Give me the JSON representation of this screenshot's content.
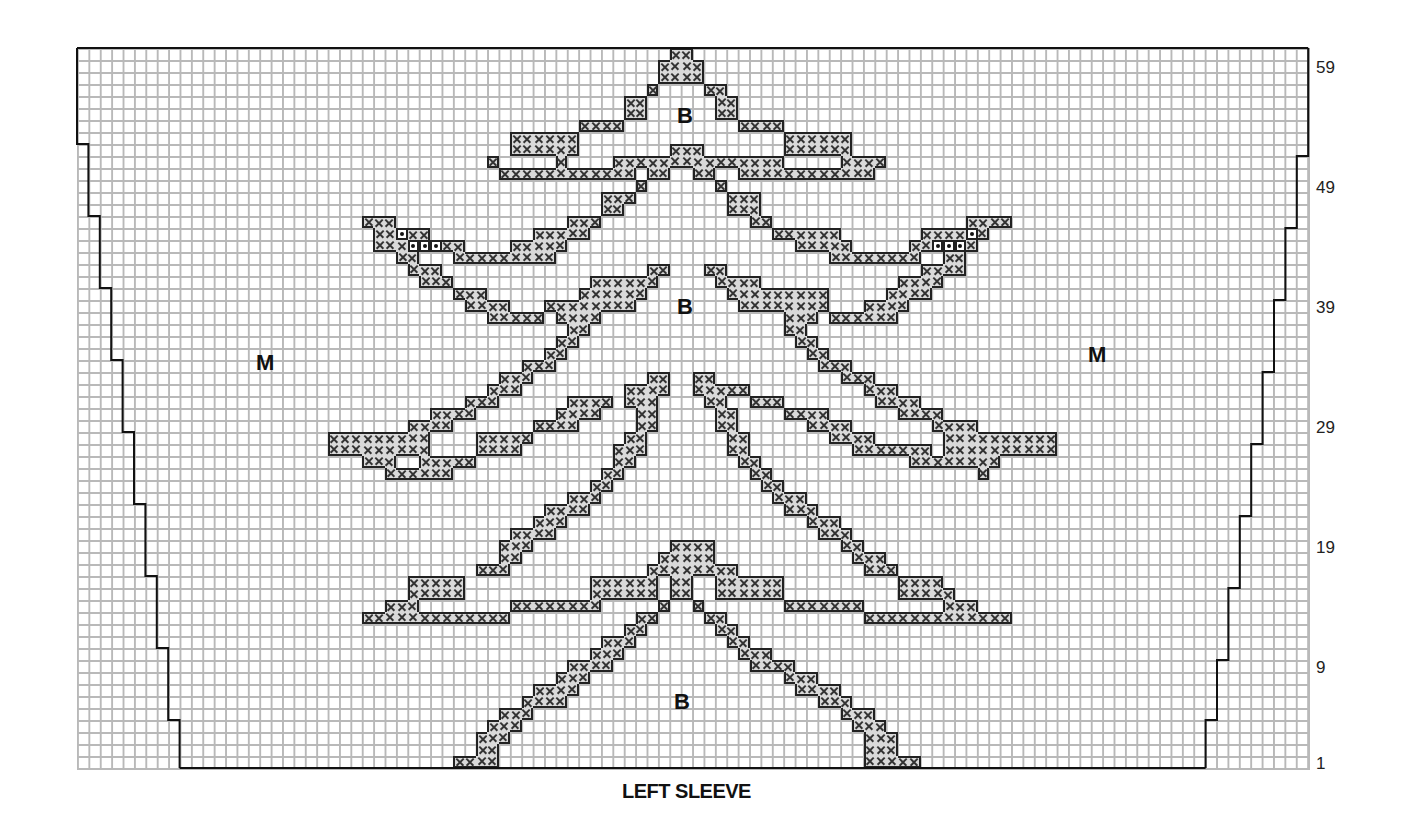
{
  "chart_data": {
    "type": "knitting-chart",
    "title": "LEFT SLEEVE",
    "grid": {
      "columns": 108,
      "rows": 60,
      "cell_w": 11.4,
      "cell_h": 12,
      "left": 77,
      "top": 48
    },
    "row_labels": [
      "59",
      "49",
      "39",
      "29",
      "19",
      "9",
      "1"
    ],
    "row_label_rows": [
      59,
      49,
      39,
      29,
      19,
      9,
      1
    ],
    "color_key": [
      {
        "symbol": "M",
        "meaning": "main color (background)"
      },
      {
        "symbol": "B",
        "meaning": "contrast color B"
      },
      {
        "symbol": "x",
        "meaning": "contrast stitch"
      },
      {
        "symbol": "•",
        "meaning": "special stitch (dot)"
      }
    ],
    "zone_labels": [
      {
        "text": "M",
        "x": 256,
        "y": 350
      },
      {
        "text": "M",
        "x": 1088,
        "y": 342
      },
      {
        "text": "B",
        "x": 677,
        "y": 103
      },
      {
        "text": "B",
        "x": 677,
        "y": 294
      },
      {
        "text": "B",
        "x": 674,
        "y": 689
      }
    ],
    "outline_left": [
      [
        0,
        60
      ],
      [
        0,
        52
      ],
      [
        1,
        52
      ],
      [
        1,
        46
      ],
      [
        2,
        46
      ],
      [
        2,
        40
      ],
      [
        3,
        40
      ],
      [
        3,
        34
      ],
      [
        4,
        34
      ],
      [
        4,
        28
      ],
      [
        5,
        28
      ],
      [
        5,
        22
      ],
      [
        6,
        22
      ],
      [
        6,
        16
      ],
      [
        7,
        16
      ],
      [
        7,
        10
      ],
      [
        8,
        10
      ],
      [
        8,
        4
      ],
      [
        9,
        4
      ],
      [
        9,
        0
      ]
    ],
    "outline_right": [
      [
        108,
        60
      ],
      [
        108,
        51
      ],
      [
        107,
        51
      ],
      [
        107,
        45
      ],
      [
        106,
        45
      ],
      [
        106,
        39
      ],
      [
        105,
        39
      ],
      [
        105,
        33
      ],
      [
        104,
        33
      ],
      [
        104,
        27
      ],
      [
        103,
        27
      ],
      [
        103,
        21
      ],
      [
        102,
        21
      ],
      [
        102,
        15
      ],
      [
        101,
        15
      ],
      [
        101,
        9
      ],
      [
        100,
        9
      ],
      [
        100,
        4
      ],
      [
        99,
        4
      ],
      [
        99,
        0
      ]
    ],
    "stitch_runs": [
      [
        60,
        52,
        53
      ],
      [
        59,
        51,
        54
      ],
      [
        58,
        51,
        54
      ],
      [
        57,
        50,
        50
      ],
      [
        57,
        55,
        56
      ],
      [
        56,
        48,
        49
      ],
      [
        56,
        56,
        57
      ],
      [
        55,
        48,
        49
      ],
      [
        55,
        56,
        57
      ],
      [
        54,
        44,
        47
      ],
      [
        54,
        58,
        61
      ],
      [
        53,
        38,
        43
      ],
      [
        53,
        62,
        67
      ],
      [
        52,
        38,
        43
      ],
      [
        52,
        52,
        54
      ],
      [
        52,
        62,
        67
      ],
      [
        51,
        36,
        36
      ],
      [
        51,
        42,
        42
      ],
      [
        51,
        47,
        50
      ],
      [
        51,
        51,
        55
      ],
      [
        51,
        56,
        60
      ],
      [
        51,
        61,
        61
      ],
      [
        51,
        67,
        70
      ],
      [
        50,
        37,
        46
      ],
      [
        50,
        47,
        48
      ],
      [
        50,
        50,
        51
      ],
      [
        50,
        54,
        55
      ],
      [
        50,
        58,
        69
      ],
      [
        49,
        49,
        49
      ],
      [
        49,
        56,
        56
      ],
      [
        48,
        46,
        48
      ],
      [
        48,
        57,
        59
      ],
      [
        47,
        46,
        47
      ],
      [
        47,
        57,
        59
      ],
      [
        46,
        25,
        27
      ],
      [
        46,
        43,
        45
      ],
      [
        46,
        59,
        60
      ],
      [
        46,
        78,
        81
      ],
      [
        45,
        26,
        30
      ],
      [
        45,
        40,
        44
      ],
      [
        45,
        61,
        66
      ],
      [
        45,
        74,
        79
      ],
      [
        44,
        26,
        28
      ],
      [
        44,
        30,
        33
      ],
      [
        44,
        38,
        42
      ],
      [
        44,
        63,
        67
      ],
      [
        44,
        73,
        78
      ],
      [
        43,
        28,
        29
      ],
      [
        43,
        33,
        41
      ],
      [
        43,
        66,
        73
      ],
      [
        43,
        76,
        77
      ],
      [
        42,
        29,
        31
      ],
      [
        42,
        50,
        51
      ],
      [
        42,
        55,
        56
      ],
      [
        42,
        74,
        77
      ],
      [
        41,
        30,
        32
      ],
      [
        41,
        45,
        50
      ],
      [
        41,
        56,
        59
      ],
      [
        41,
        72,
        75
      ],
      [
        40,
        33,
        35
      ],
      [
        40,
        44,
        49
      ],
      [
        40,
        57,
        65
      ],
      [
        40,
        71,
        74
      ],
      [
        39,
        34,
        37
      ],
      [
        39,
        41,
        48
      ],
      [
        39,
        58,
        65
      ],
      [
        39,
        69,
        72
      ],
      [
        38,
        36,
        40
      ],
      [
        38,
        42,
        45
      ],
      [
        38,
        62,
        64
      ],
      [
        38,
        66,
        71
      ],
      [
        37,
        43,
        44
      ],
      [
        37,
        62,
        63
      ],
      [
        36,
        42,
        43
      ],
      [
        36,
        63,
        64
      ],
      [
        35,
        41,
        42
      ],
      [
        35,
        64,
        65
      ],
      [
        34,
        39,
        41
      ],
      [
        34,
        65,
        67
      ],
      [
        33,
        37,
        39
      ],
      [
        33,
        50,
        51
      ],
      [
        33,
        54,
        55
      ],
      [
        33,
        67,
        69
      ],
      [
        32,
        36,
        38
      ],
      [
        32,
        48,
        51
      ],
      [
        32,
        54,
        58
      ],
      [
        32,
        69,
        71
      ],
      [
        31,
        34,
        36
      ],
      [
        31,
        43,
        46
      ],
      [
        31,
        48,
        50
      ],
      [
        31,
        55,
        56
      ],
      [
        31,
        59,
        61
      ],
      [
        31,
        70,
        73
      ],
      [
        30,
        31,
        34
      ],
      [
        30,
        42,
        45
      ],
      [
        30,
        49,
        50
      ],
      [
        30,
        56,
        57
      ],
      [
        30,
        62,
        65
      ],
      [
        30,
        72,
        75
      ],
      [
        29,
        29,
        32
      ],
      [
        29,
        40,
        43
      ],
      [
        29,
        49,
        50
      ],
      [
        29,
        56,
        57
      ],
      [
        29,
        64,
        67
      ],
      [
        29,
        75,
        78
      ],
      [
        28,
        22,
        30
      ],
      [
        28,
        35,
        39
      ],
      [
        28,
        48,
        49
      ],
      [
        28,
        57,
        58
      ],
      [
        28,
        66,
        69
      ],
      [
        28,
        76,
        85
      ],
      [
        27,
        22,
        30
      ],
      [
        27,
        35,
        38
      ],
      [
        27,
        47,
        49
      ],
      [
        27,
        57,
        58
      ],
      [
        27,
        68,
        74
      ],
      [
        27,
        76,
        85
      ],
      [
        26,
        25,
        27
      ],
      [
        26,
        30,
        34
      ],
      [
        26,
        47,
        48
      ],
      [
        26,
        58,
        59
      ],
      [
        26,
        73,
        80
      ],
      [
        25,
        27,
        32
      ],
      [
        25,
        46,
        47
      ],
      [
        25,
        59,
        60
      ],
      [
        25,
        79,
        79
      ],
      [
        24,
        45,
        46
      ],
      [
        24,
        60,
        61
      ],
      [
        23,
        43,
        45
      ],
      [
        23,
        61,
        63
      ],
      [
        22,
        41,
        44
      ],
      [
        22,
        62,
        64
      ],
      [
        21,
        40,
        42
      ],
      [
        21,
        64,
        66
      ],
      [
        20,
        38,
        41
      ],
      [
        20,
        65,
        67
      ],
      [
        19,
        37,
        39
      ],
      [
        19,
        52,
        55
      ],
      [
        19,
        67,
        68
      ],
      [
        18,
        37,
        38
      ],
      [
        18,
        51,
        55
      ],
      [
        18,
        68,
        70
      ],
      [
        17,
        35,
        37
      ],
      [
        17,
        50,
        57
      ],
      [
        17,
        69,
        71
      ],
      [
        16,
        29,
        33
      ],
      [
        16,
        45,
        50
      ],
      [
        16,
        52,
        53
      ],
      [
        16,
        56,
        61
      ],
      [
        16,
        72,
        75
      ],
      [
        15,
        29,
        33
      ],
      [
        15,
        45,
        50
      ],
      [
        15,
        52,
        53
      ],
      [
        15,
        56,
        61
      ],
      [
        15,
        72,
        76
      ],
      [
        14,
        27,
        29
      ],
      [
        14,
        38,
        45
      ],
      [
        14,
        51,
        51
      ],
      [
        14,
        54,
        54
      ],
      [
        14,
        62,
        68
      ],
      [
        14,
        76,
        78
      ],
      [
        13,
        25,
        37
      ],
      [
        13,
        49,
        50
      ],
      [
        13,
        55,
        56
      ],
      [
        13,
        69,
        81
      ],
      [
        12,
        48,
        49
      ],
      [
        12,
        56,
        57
      ],
      [
        11,
        46,
        48
      ],
      [
        11,
        57,
        58
      ],
      [
        10,
        45,
        47
      ],
      [
        10,
        58,
        60
      ],
      [
        9,
        43,
        46
      ],
      [
        9,
        59,
        62
      ],
      [
        8,
        42,
        44
      ],
      [
        8,
        62,
        64
      ],
      [
        7,
        40,
        43
      ],
      [
        7,
        63,
        66
      ],
      [
        6,
        39,
        42
      ],
      [
        6,
        65,
        67
      ],
      [
        5,
        37,
        39
      ],
      [
        5,
        67,
        69
      ],
      [
        4,
        36,
        38
      ],
      [
        4,
        68,
        70
      ],
      [
        3,
        35,
        37
      ],
      [
        3,
        69,
        71
      ],
      [
        2,
        35,
        36
      ],
      [
        2,
        69,
        71
      ],
      [
        1,
        33,
        36
      ],
      [
        1,
        69,
        73
      ]
    ],
    "dot_cells": [
      [
        45,
        28
      ],
      [
        44,
        29
      ],
      [
        44,
        30
      ],
      [
        44,
        31
      ],
      [
        45,
        78
      ],
      [
        44,
        75
      ],
      [
        44,
        76
      ],
      [
        44,
        77
      ]
    ]
  }
}
